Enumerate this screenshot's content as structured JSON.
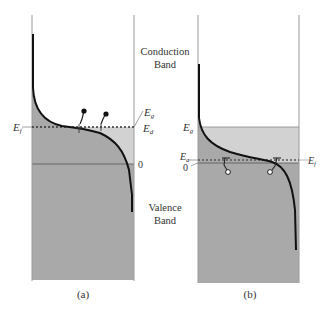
{
  "figure": {
    "band_labels": {
      "conduction_line1": "Conduction",
      "conduction_line2": "Band",
      "valence_line1": "Valence",
      "valence_line2": "Band"
    },
    "panel_a": {
      "caption": "(a)",
      "labels": {
        "left_level": "E",
        "left_level_sub": "f",
        "right_upper": "E",
        "right_upper_sub": "g",
        "right_lower": "E",
        "right_lower_sub": "d",
        "zero": "0"
      },
      "carriers": "electrons"
    },
    "panel_b": {
      "caption": "(b)",
      "labels": {
        "top_level": "E",
        "top_level_sub": "g",
        "left_level": "E",
        "left_level_sub": "a",
        "zero": "0",
        "right_level": "E",
        "right_level_sub": "f"
      },
      "carriers": "holes"
    },
    "colors": {
      "dark_fill": "#a9a9a9",
      "light_fill": "#d2d2d2",
      "frame": "#9a9a9a",
      "curve": "#111111"
    }
  }
}
